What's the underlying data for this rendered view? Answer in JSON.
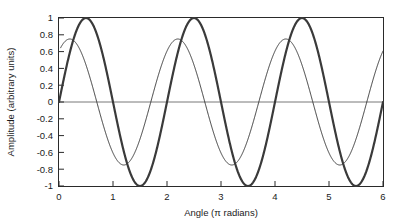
{
  "chart_data": {
    "type": "line",
    "title": "",
    "xlabel": "Angle (π radians)",
    "ylabel": "Amplitude (arbitrary units)",
    "xlim": [
      0,
      6
    ],
    "ylim": [
      -1,
      1
    ],
    "grid": false,
    "legend": "none",
    "x_ticks": [
      "0",
      "1",
      "2",
      "3",
      "4",
      "5",
      "6"
    ],
    "x_tick_values": [
      0,
      1,
      2,
      3,
      4,
      5,
      6
    ],
    "y_ticks": [
      "1",
      "0.8",
      "0.6",
      "0.4",
      "0.2",
      "0",
      "-0.2",
      "-0.4",
      "-0.6",
      "-0.8",
      "-1"
    ],
    "y_tick_values": [
      1,
      0.8,
      0.6,
      0.4,
      0.2,
      0,
      -0.2,
      -0.4,
      -0.6,
      -0.8,
      -1
    ],
    "zero_line": 0,
    "series": [
      {
        "name": "thick-wave",
        "description": "sin wave amplitude 1, period 2 pi-radians, peaks at 0.5, 2.5, 4.5",
        "amplitude": 1.0,
        "period": 2.0,
        "phase": 0.0,
        "line_width": 2.2,
        "color": "#3a3a3a",
        "x": [
          0,
          0.1,
          0.2,
          0.3,
          0.4,
          0.5,
          0.6,
          0.7,
          0.8,
          0.9,
          1.0,
          1.1,
          1.2,
          1.3,
          1.4,
          1.5,
          1.6,
          1.7,
          1.8,
          1.9,
          2.0,
          2.1,
          2.2,
          2.3,
          2.4,
          2.5,
          2.6,
          2.7,
          2.8,
          2.9,
          3.0,
          3.1,
          3.2,
          3.3,
          3.4,
          3.5,
          3.6,
          3.7,
          3.8,
          3.9,
          4.0,
          4.1,
          4.2,
          4.3,
          4.4,
          4.5,
          4.6,
          4.7,
          4.8,
          4.9,
          5.0,
          5.1,
          5.2,
          5.3,
          5.4,
          5.5,
          5.6,
          5.7,
          5.8,
          5.9,
          6.0
        ],
        "values": [
          0,
          0.309,
          0.588,
          0.809,
          0.951,
          1.0,
          0.951,
          0.809,
          0.588,
          0.309,
          0,
          -0.309,
          -0.588,
          -0.809,
          -0.951,
          -1.0,
          -0.951,
          -0.809,
          -0.588,
          -0.309,
          0,
          0.309,
          0.588,
          0.809,
          0.951,
          1.0,
          0.951,
          0.809,
          0.588,
          0.309,
          0,
          -0.309,
          -0.588,
          -0.809,
          -0.951,
          -1.0,
          -0.951,
          -0.809,
          -0.588,
          -0.309,
          0,
          0.309,
          0.588,
          0.809,
          0.951,
          1.0,
          0.951,
          0.809,
          0.588,
          0.309,
          0,
          -0.309,
          -0.588,
          -0.809,
          -0.951,
          -1.0,
          -0.951,
          -0.809,
          -0.588,
          -0.309,
          0
        ]
      },
      {
        "name": "thin-wave",
        "description": "phase-leading wave, amplitude about 0.75, period 2 pi-radians, peaks near 0.35, 2.35, 4.35",
        "amplitude": 0.75,
        "period": 2.0,
        "phase": 0.3,
        "line_width": 1.0,
        "color": "#3a3a3a",
        "x": [
          0,
          0.1,
          0.2,
          0.3,
          0.4,
          0.5,
          0.6,
          0.7,
          0.8,
          0.9,
          1.0,
          1.1,
          1.2,
          1.3,
          1.4,
          1.5,
          1.6,
          1.7,
          1.8,
          1.9,
          2.0,
          2.1,
          2.2,
          2.3,
          2.4,
          2.5,
          2.6,
          2.7,
          2.8,
          2.9,
          3.0,
          3.1,
          3.2,
          3.3,
          3.4,
          3.5,
          3.6,
          3.7,
          3.8,
          3.9,
          4.0,
          4.1,
          4.2,
          4.3,
          4.4,
          4.5,
          4.6,
          4.7,
          4.8,
          4.9,
          5.0,
          5.1,
          5.2,
          5.3,
          5.4,
          5.5,
          5.6,
          5.7,
          5.8,
          5.9,
          6.0
        ],
        "values": [
          0.555,
          0.673,
          0.736,
          0.742,
          0.691,
          0.587,
          0.436,
          0.248,
          0.037,
          -0.182,
          -0.391,
          -0.577,
          -0.767,
          -0.736,
          -0.748,
          -0.742,
          -0.691,
          -0.587,
          -0.436,
          -0.248,
          -0.037,
          0.182,
          0.391,
          0.577,
          0.707,
          0.736,
          0.742,
          0.691,
          0.587,
          0.436,
          0.248,
          0.037,
          -0.182,
          -0.391,
          -0.577,
          -0.707,
          -0.736,
          -0.742,
          -0.691,
          -0.587,
          -0.436,
          -0.248,
          -0.037,
          0.182,
          0.391,
          0.577,
          0.707,
          0.736,
          0.742,
          0.691,
          0.587,
          0.436,
          0.248,
          0.037,
          -0.182,
          -0.391,
          -0.577,
          -0.707,
          -0.736,
          -0.742,
          -0.1
        ]
      }
    ]
  },
  "axes": {
    "x_title": "Angle (π radians)",
    "y_title": "Amplitude (arbitrary units)"
  },
  "colors": {
    "frame": "#2a2a2a",
    "curve": "#3a3a3a",
    "zero_line": "#6a6a6a",
    "text": "#1b1b1b",
    "background": "#ffffff"
  }
}
